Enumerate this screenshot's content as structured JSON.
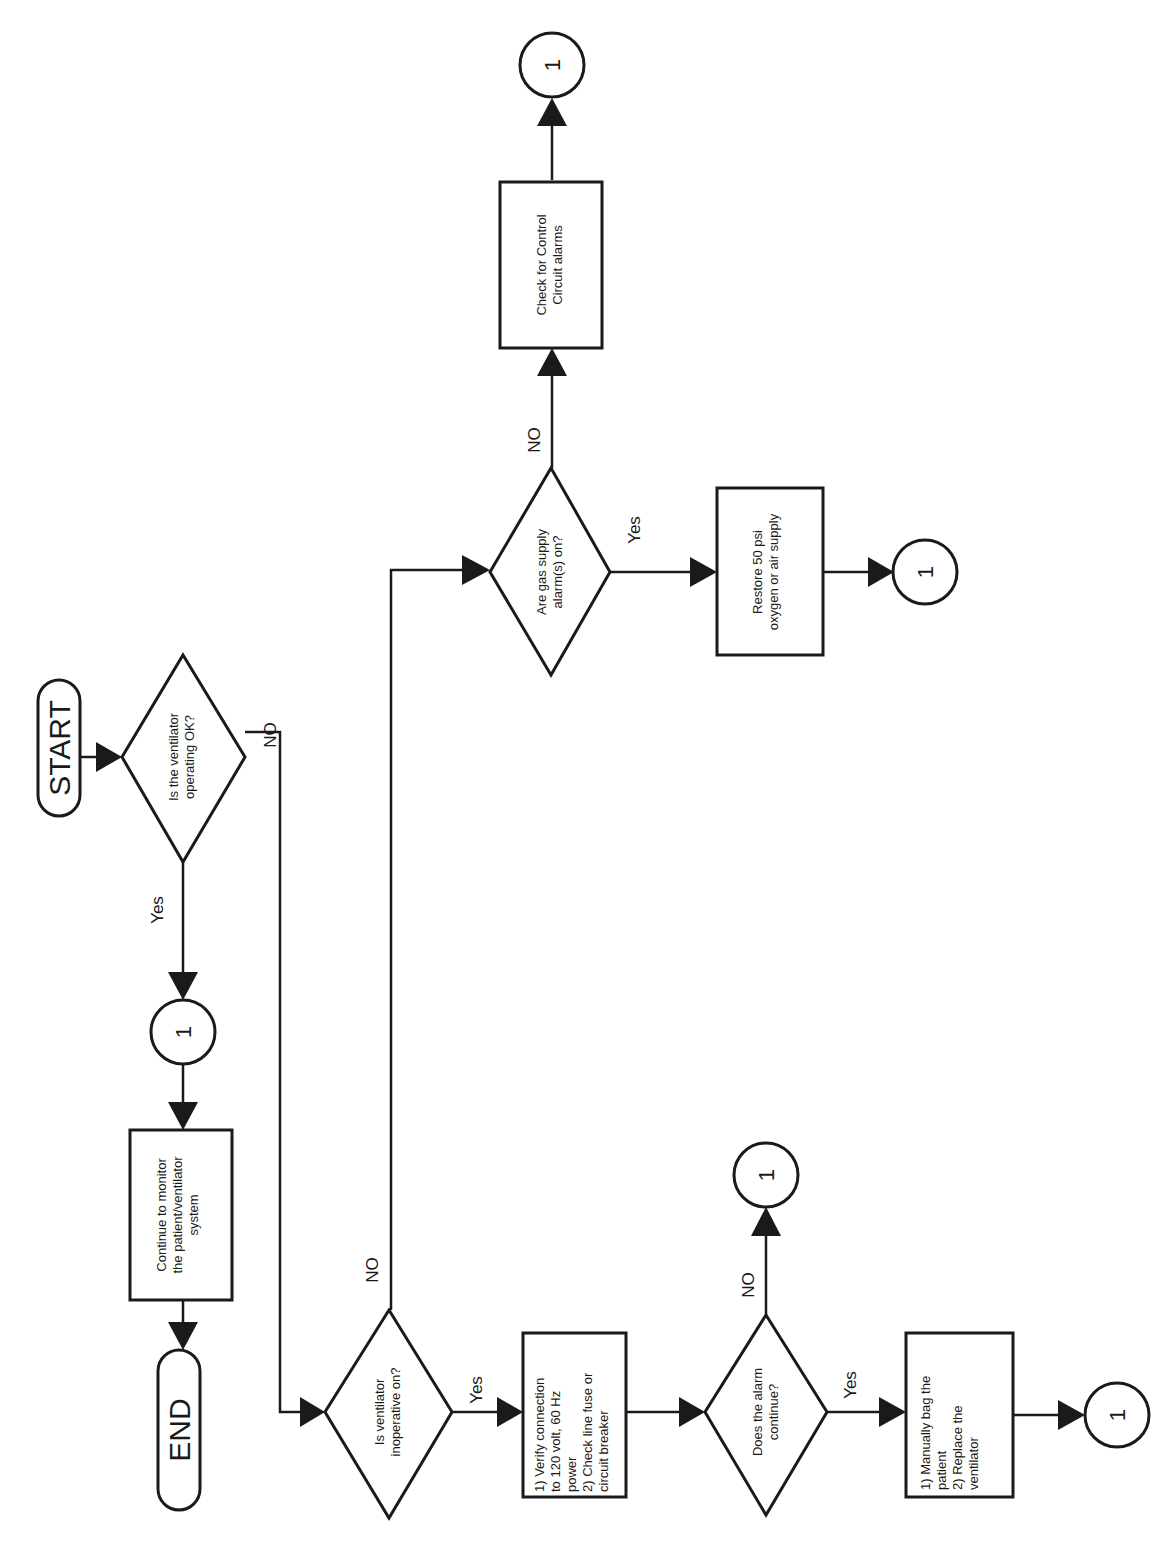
{
  "diagram": {
    "orientation": "rotated-90-ccw",
    "nodes": {
      "start": {
        "label": "START"
      },
      "end": {
        "label": "END"
      },
      "q_operating_ok": {
        "line1": "Is the ventilator",
        "line2": "operating OK?"
      },
      "q_inoperative_on": {
        "line1": "Is ventilator",
        "line2": "inoperative on?"
      },
      "q_gas_supply": {
        "line1": "Are gas supply",
        "line2": "alarm(s) on?"
      },
      "q_alarm_continue": {
        "line1": "Does the alarm",
        "line2": "continue?"
      },
      "box_continue_monitor": {
        "line1": "Continue to monitor",
        "line2": "the patient/ventilator",
        "line3": "system"
      },
      "box_verify_power": {
        "line1": "1) Verify connection",
        "line2": "to 120 volt, 60 Hz",
        "line3": "power",
        "line4": "2) Check line fuse or",
        "line5": "circuit breaker"
      },
      "box_check_control": {
        "line1": "Check for Control",
        "line2": "Circuit alarms"
      },
      "box_restore_psi": {
        "line1": "Restore 50 psi",
        "line2": "oxygen or air supply"
      },
      "box_bag_patient": {
        "line1": "1) Manually bag the",
        "line2": "patient",
        "line3": "2) Replace the",
        "line4": "ventilator"
      },
      "connector_a": {
        "label": "1"
      },
      "connector_b": {
        "label": "1"
      },
      "connector_c": {
        "label": "1"
      },
      "connector_d": {
        "label": "1"
      },
      "connector_e": {
        "label": "1"
      }
    },
    "edge_labels": {
      "q1_yes": "Yes",
      "q1_no": "NO",
      "q2_yes": "Yes",
      "q2_no": "NO",
      "q3_yes": "Yes",
      "q3_no": "NO",
      "q4_yes": "Yes",
      "q4_no": "NO"
    }
  }
}
